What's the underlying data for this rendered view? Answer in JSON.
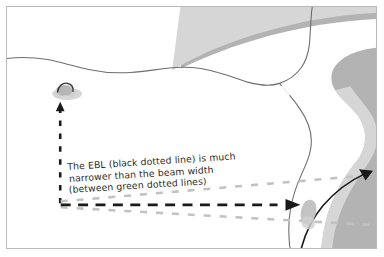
{
  "figure": {
    "name": "ebl-beam-width-diagram",
    "border_color": "#b9b9b9",
    "background_color": "#ffffff"
  },
  "annotation": {
    "line1": "The EBL (black dotted line) is much",
    "line2": "narrower than the beam width",
    "line3": "(between green dotted lines)",
    "full_text": "The EBL (black dotted line) is much narrower than the beam width (between green dotted lines)",
    "color": "#2b2b2b"
  },
  "legend_terms": {
    "ebl_label": "EBL",
    "ebl_style": "black dotted line",
    "beam_width_style": "green dotted lines"
  },
  "colors": {
    "land_outer": "#b3b3b3",
    "land_inner": "#d6d6d6",
    "coastline_stroke": "#6e6e6e",
    "ebl_line": "#1a1a1a",
    "beam_line": "#c2c2c2",
    "target_blob": "#c9c9c9",
    "target_core": "#a8a8a8",
    "target_outline": "#3a3a3a"
  },
  "elements": {
    "own_ship_marker": "own-ship-target-blob",
    "vertical_ebl_label": "vertical-ebl-dashed-line",
    "horizontal_ebl_label": "horizontal-ebl-dashed-line",
    "beam_upper_label": "upper-beam-width-dashed-line",
    "beam_lower_label": "lower-beam-width-dashed-line",
    "curved_arrow_label": "curved-sweep-arrow",
    "coastline_label": "radar-coastline-echo"
  }
}
